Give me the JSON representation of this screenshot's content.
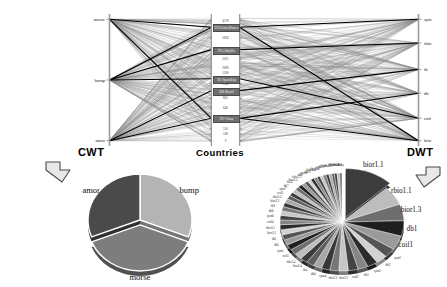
{
  "figure": {
    "type": "parallel-coordinates-plus-pies",
    "background": "#ffffff"
  },
  "pcp": {
    "title_left": "CWT",
    "title_middle": "Countries",
    "title_right": "DWT",
    "axes": [
      {
        "id": "cwt",
        "name": "CWT",
        "side": "left",
        "ticks": [
          "morse",
          "bump",
          "amor"
        ],
        "tick_positions_pct": [
          4,
          50,
          96
        ]
      },
      {
        "id": "countries",
        "name": "Countries",
        "side": "middle",
        "highlighted": [
          {
            "label": "US UnitedStates",
            "pos_pct": 10
          },
          {
            "label": "ITA ItalyIta",
            "pos_pct": 27
          },
          {
            "label": "ES SpainEsp",
            "pos_pct": 49
          },
          {
            "label": "BR Brazil",
            "pos_pct": 58
          },
          {
            "label": "IN China",
            "pos_pct": 79
          }
        ],
        "minor_ticks": [
          {
            "label": "4578",
            "pos_pct": 5
          },
          {
            "label": "3856",
            "pos_pct": 18
          },
          {
            "label": "3011",
            "pos_pct": 34
          },
          {
            "label": "2690",
            "pos_pct": 41
          },
          {
            "label": "1200",
            "pos_pct": 45
          },
          {
            "label": "1065",
            "pos_pct": 53
          },
          {
            "label": "805",
            "pos_pct": 64
          },
          {
            "label": "640",
            "pos_pct": 71
          },
          {
            "label": "310",
            "pos_pct": 87
          },
          {
            "label": "180",
            "pos_pct": 91
          },
          {
            "label": "0",
            "pos_pct": 96
          }
        ]
      },
      {
        "id": "dwt",
        "name": "DWT",
        "side": "right",
        "ticks": [
          "sym",
          "rbio",
          "fk",
          "db",
          "coif",
          "bior"
        ],
        "tick_positions_pct": [
          4,
          22,
          42,
          60,
          79,
          96
        ]
      }
    ],
    "line_style": {
      "normal_color": "#8c8c8c",
      "highlight_color": "#000000",
      "normal_count": 330,
      "highlight_count": 7
    }
  },
  "arrows": {
    "left": {
      "name": "arrow-cwt-to-pie",
      "direction": "down-right"
    },
    "right": {
      "name": "arrow-dwt-to-pie",
      "direction": "down-left"
    }
  },
  "chart_data": [
    {
      "type": "pie",
      "id": "cwt-pie",
      "title": "",
      "labels": [
        "bump",
        "morse",
        "amor"
      ],
      "values": [
        31,
        38,
        31
      ],
      "colors": [
        "#b4b4b4",
        "#7d7d7d",
        "#4a4a4a"
      ],
      "exploded": [
        "morse"
      ],
      "legend": "labels-outside"
    },
    {
      "type": "pie",
      "id": "dwt-pie",
      "title": "",
      "labels": [
        "bior1.1",
        "rbio1.1",
        "bior1.3",
        "db1",
        "coif1",
        "sym2",
        "db2",
        "sym3",
        "db3",
        "coif2",
        "bior2.2",
        "rbio2.2",
        "sym4",
        "db4",
        "fk4",
        "bior2.4",
        "rbio2.4",
        "coif3",
        "sym5",
        "db5",
        "fk6",
        "bior3.1",
        "rbio3.1",
        "coif4",
        "sym6",
        "db6",
        "fk8",
        "bior3.3",
        "rbio3.3",
        "coif5",
        "sym7",
        "db7",
        "fk14",
        "bior3.5",
        "rbio3.5",
        "db8",
        "sym8",
        "fk18",
        "bior4.4",
        "rbio4.4",
        "db9",
        "fk22",
        "bior5.5",
        "rbio5.5",
        "db10",
        "bior6.8",
        "rbio6.8",
        "dmey"
      ],
      "values": [
        12.5,
        6.2,
        5.4,
        5.0,
        4.6,
        3.0,
        2.9,
        2.7,
        2.6,
        2.5,
        2.4,
        2.3,
        2.2,
        2.1,
        2.0,
        1.95,
        1.9,
        1.85,
        1.8,
        1.75,
        1.7,
        1.65,
        1.6,
        1.55,
        1.5,
        1.45,
        1.4,
        1.35,
        1.3,
        1.25,
        1.2,
        1.15,
        1.1,
        1.05,
        1.0,
        0.95,
        0.9,
        0.88,
        0.85,
        0.82,
        0.8,
        0.78,
        0.75,
        0.72,
        0.7,
        0.68,
        0.65,
        0.6
      ],
      "exploded": [
        "bior1.1"
      ],
      "emphasized_labels": [
        "rbio1.1",
        "bior1.1",
        "db1",
        "bior1.3",
        "coif1"
      ],
      "legend": "labels-outside"
    }
  ]
}
